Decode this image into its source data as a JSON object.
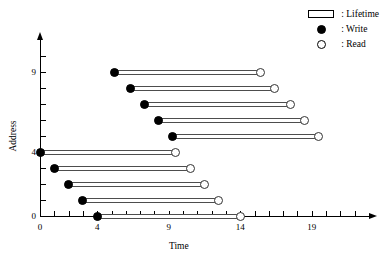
{
  "chart_data": {
    "type": "scatter",
    "title": "",
    "xlabel": "Time",
    "ylabel": "Address",
    "xlim": [
      0,
      23
    ],
    "ylim": [
      0,
      11
    ],
    "grid": false,
    "legend_position": "top-right",
    "x_ticks": [
      0,
      1,
      2,
      3,
      4,
      5,
      6,
      7,
      8,
      9,
      10,
      11,
      12,
      13,
      14,
      15,
      16,
      17,
      18,
      19,
      20,
      21,
      22
    ],
    "x_tick_labels": {
      "0": "0",
      "4": "4",
      "9": "9",
      "14": "14",
      "19": "19"
    },
    "y_ticks": [
      0,
      1,
      2,
      3,
      4,
      5,
      6,
      7,
      8,
      9,
      10
    ],
    "y_tick_labels": {
      "0": "0",
      "4": "4",
      "9": "9"
    },
    "series": [
      {
        "name": "Lifetime",
        "marker_start": "Write",
        "marker_end": "Read",
        "bars": [
          {
            "address": 9,
            "write": 5.2,
            "read": 15.4
          },
          {
            "address": 8,
            "write": 6.3,
            "read": 16.4
          },
          {
            "address": 7,
            "write": 7.3,
            "read": 17.5
          },
          {
            "address": 6,
            "write": 8.3,
            "read": 18.5
          },
          {
            "address": 5,
            "write": 9.3,
            "read": 19.5
          },
          {
            "address": 4,
            "write": 0.0,
            "read": 9.5
          },
          {
            "address": 3,
            "write": 1.0,
            "read": 10.5
          },
          {
            "address": 2,
            "write": 2.0,
            "read": 11.5
          },
          {
            "address": 1,
            "write": 3.0,
            "read": 12.5
          },
          {
            "address": 0,
            "write": 4.0,
            "read": 14.0
          }
        ]
      }
    ]
  },
  "legend": {
    "items": [
      {
        "symbol": "lifetime-box",
        "label": ": Lifetime"
      },
      {
        "symbol": "filled-circle",
        "label": ": Write"
      },
      {
        "symbol": "open-circle",
        "label": ": Read"
      }
    ]
  },
  "colors": {
    "axis": "#000000",
    "bar_outline": "#4d4d4d",
    "write_marker": "#000000",
    "read_marker": "#ffffff",
    "background": "#ffffff"
  }
}
